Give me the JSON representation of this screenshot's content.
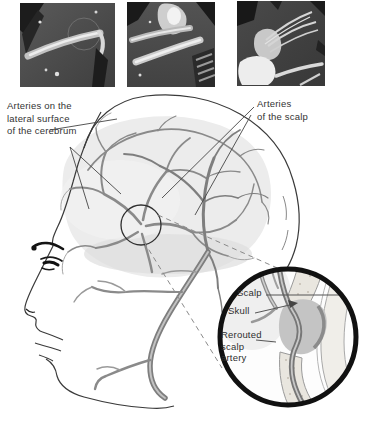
{
  "figure": {
    "type": "anatomical illustration with operative photographs",
    "caption_labels": {
      "cerebrum_arteries": "Arteries on the\nlateral surface\nof the cerebrum",
      "scalp_arteries": "Arteries\nof the scalp"
    },
    "inset_labels": {
      "scalp": "Scalp",
      "skull": "Skull",
      "rerouted": "Rerouted\nscalp\nartery"
    },
    "photos": {
      "count": 3
    },
    "icons": {
      "magnifier_inset": "magnified-cross-section-circle",
      "site_marker": "anastomosis-site-circle",
      "arrow": "skull-pointer-arrow"
    },
    "colors": {
      "background": "#ffffff",
      "ink": "#3a3a3a",
      "label_text": "#333333",
      "artery_gray": "#868686",
      "brain_wash": "#ececec",
      "photo_dark": "#474747",
      "skull_bone": "#e9e6df",
      "inset_border": "#111111"
    }
  }
}
